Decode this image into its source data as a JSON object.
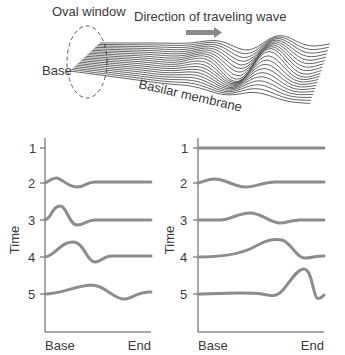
{
  "top_figure": {
    "oval_window_label": "Oval window",
    "direction_label": "Direction of traveling wave",
    "base_label": "Base",
    "membrane_label": "Basilar membrane",
    "arrow_color": "#8a8a8a",
    "line_color": "#222222"
  },
  "charts": {
    "curve_color": "#8c8c8c",
    "left": {
      "y_label": "Time",
      "y_ticks": [
        "1",
        "2",
        "3",
        "4",
        "5"
      ],
      "x_start_label": "Base",
      "x_end_label": "End"
    },
    "right": {
      "y_label": "Time",
      "y_ticks": [
        "1",
        "2",
        "3",
        "4",
        "5"
      ],
      "x_start_label": "Base",
      "x_end_label": "End"
    }
  },
  "chart_data": [
    {
      "type": "line",
      "title": "Low-frequency-like traveling wave (peak near base)",
      "xlabel": "Base → End",
      "ylabel": "Time",
      "y_ticks": [
        1,
        2,
        3,
        4,
        5
      ],
      "series": [
        {
          "name": "t2",
          "shape": "small bump near base, damped by 40% of length"
        },
        {
          "name": "t3",
          "shape": "larger bump near base at ~15%, flat after ~45%"
        },
        {
          "name": "t4",
          "shape": "peak at ~28%, trough at ~48%, flat after"
        },
        {
          "name": "t5",
          "shape": "broad peak at ~45%, trough at ~75%, recovering at end"
        }
      ]
    },
    {
      "type": "line",
      "title": "High-frequency-like traveling wave (peak near end)",
      "xlabel": "Base → End",
      "ylabel": "Time",
      "y_ticks": [
        1,
        2,
        3,
        4,
        5
      ],
      "series": [
        {
          "name": "t1",
          "shape": "flat"
        },
        {
          "name": "t2",
          "shape": "small bump at ~15%, dip at ~38%"
        },
        {
          "name": "t3",
          "shape": "bump at ~42%, dip at ~72%"
        },
        {
          "name": "t4",
          "shape": "peak at ~68%, dip at ~85%"
        },
        {
          "name": "t5",
          "shape": "sharp peak at ~85%, sharp dip at end"
        }
      ]
    }
  ]
}
